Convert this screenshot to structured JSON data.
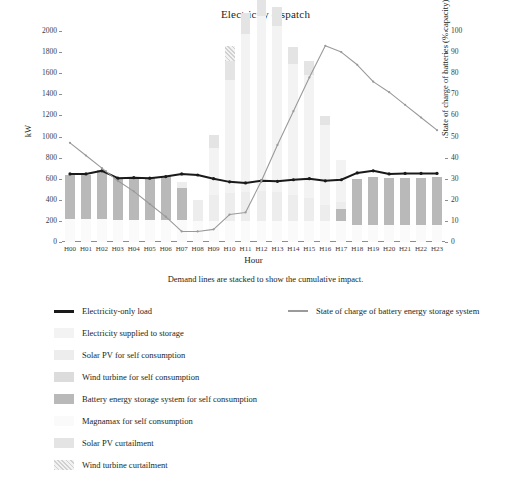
{
  "chart_data": {
    "type": "bar",
    "title": "Electricity dispatch",
    "subtitle": "Demand lines are stacked to show the cumulative impact.",
    "xlabel": "Hour",
    "ylabel": "kW",
    "ylabel_right": "State of charge of batteries (% capacity)",
    "ylim": [
      0,
      2000
    ],
    "ylim_right": [
      0,
      100
    ],
    "ytick_step": 200,
    "ytick_step_right": 10,
    "grid": false,
    "legend_position": "below",
    "categories": [
      "H00",
      "H01",
      "H02",
      "H03",
      "H04",
      "H05",
      "H06",
      "H07",
      "H08",
      "H09",
      "H10",
      "H11",
      "H12",
      "H13",
      "H14",
      "H15",
      "H16",
      "H17",
      "H18",
      "H19",
      "H20",
      "H21",
      "H22",
      "H23"
    ],
    "yticks": [
      "0",
      "200",
      "400",
      "600",
      "800",
      "1000",
      "1200",
      "1400",
      "1600",
      "1800",
      "2000"
    ],
    "yticks_right": [
      "0",
      "10",
      "20",
      "30",
      "40",
      "50",
      "60",
      "70",
      "80",
      "90",
      "100"
    ],
    "series": [
      {
        "name": "Electricity supplied to storage",
        "kind": "bar",
        "color": "#f3f3f3",
        "values": [
          0,
          0,
          0,
          0,
          0,
          0,
          0,
          0,
          0,
          440,
          1080,
          1500,
          1660,
          1580,
          1240,
          1160,
          760,
          400,
          0,
          0,
          0,
          0,
          0,
          0
        ]
      },
      {
        "name": "Solar PV for self consumption",
        "kind": "bar",
        "color": "#ededed",
        "values": [
          0,
          0,
          0,
          0,
          0,
          0,
          0,
          60,
          200,
          250,
          260,
          270,
          280,
          270,
          250,
          220,
          150,
          70,
          0,
          0,
          0,
          0,
          0,
          0
        ]
      },
      {
        "name": "Wind turbine for self consumption",
        "kind": "bar",
        "color": "#dcdcdc",
        "values": [
          0,
          0,
          0,
          0,
          0,
          0,
          0,
          0,
          0,
          0,
          0,
          0,
          0,
          0,
          0,
          0,
          0,
          0,
          0,
          0,
          0,
          0,
          0,
          0
        ]
      },
      {
        "name": "Battery energy storage system for self consumption",
        "kind": "bar",
        "color": "#b9b9b9",
        "values": [
          420,
          420,
          460,
          400,
          400,
          400,
          420,
          300,
          0,
          0,
          0,
          0,
          0,
          0,
          0,
          0,
          0,
          110,
          440,
          460,
          450,
          450,
          450,
          460
        ]
      },
      {
        "name": "Magnamax for self consumption",
        "kind": "bar",
        "color": "#fafafa",
        "values": [
          220,
          220,
          220,
          210,
          210,
          210,
          210,
          210,
          200,
          200,
          200,
          200,
          200,
          200,
          200,
          200,
          200,
          200,
          160,
          160,
          160,
          160,
          160,
          160
        ]
      },
      {
        "name": "Solar PV curtailment",
        "kind": "bar",
        "color": "#e4e4e4",
        "values": [
          0,
          0,
          0,
          0,
          0,
          0,
          0,
          0,
          0,
          120,
          180,
          200,
          190,
          180,
          160,
          140,
          80,
          0,
          0,
          0,
          0,
          0,
          0,
          0
        ]
      },
      {
        "name": "Wind turbine curtailment",
        "kind": "bar",
        "color": "#d0d0d0",
        "pattern": "hatched",
        "values": [
          0,
          0,
          0,
          0,
          0,
          0,
          0,
          0,
          0,
          0,
          140,
          0,
          0,
          0,
          0,
          0,
          0,
          0,
          0,
          0,
          0,
          0,
          0,
          0
        ]
      },
      {
        "name": "Electricity-only load",
        "kind": "line",
        "color": "#1a1a1a",
        "axis": "left",
        "values": [
          645,
          645,
          675,
          605,
          610,
          605,
          620,
          645,
          635,
          600,
          570,
          560,
          580,
          575,
          590,
          600,
          580,
          590,
          655,
          675,
          645,
          650,
          650,
          650
        ]
      },
      {
        "name": "State of charge of battery energy storage system",
        "kind": "line",
        "color": "#9a9a9a",
        "axis": "right",
        "values": [
          47,
          41,
          35,
          29,
          24,
          18,
          12,
          5,
          5,
          6,
          13,
          14,
          29,
          46,
          62,
          78,
          93,
          90,
          84,
          76,
          71,
          65,
          59,
          53
        ]
      }
    ]
  },
  "legend": {
    "rows": [
      {
        "col1": {
          "label": "Electricity-only load",
          "marker": "line-black"
        },
        "col2": {
          "label": "State of charge of battery energy storage system",
          "marker": "line-gray"
        }
      },
      {
        "col1": {
          "label": "Electricity supplied to storage",
          "marker": "swatch-storage"
        }
      },
      {
        "col1": {
          "label": "Solar PV for self consumption",
          "marker": "swatch-solar"
        }
      },
      {
        "col1": {
          "label": "Wind turbine for self consumption",
          "marker": "swatch-wind"
        }
      },
      {
        "col1": {
          "label": "Battery energy storage system for self consumption",
          "marker": "swatch-battery"
        }
      },
      {
        "col1": {
          "label": "Magnamax for self consumption",
          "marker": "swatch-magnamax"
        }
      },
      {
        "col1": {
          "label": "Solar PV curtailment",
          "marker": "swatch-solar-curt"
        }
      },
      {
        "col1": {
          "label": "Wind turbine curtailment",
          "marker": "swatch-wind-curt"
        }
      }
    ]
  }
}
